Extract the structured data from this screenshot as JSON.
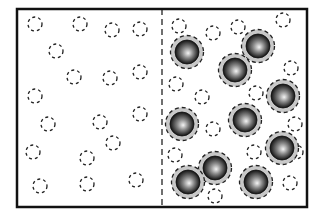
{
  "diagram": {
    "kind": "particle-membrane-diagram",
    "frame": {
      "x": 17,
      "y": 9,
      "width": 290,
      "height": 198,
      "stroke": "#111111"
    },
    "divider": {
      "x": 162,
      "style": "dashed",
      "stroke": "#111111"
    },
    "colors": {
      "small_dash": "#222222",
      "halo": "#c8c8c8",
      "halo_dash": "#222222",
      "sphere_dark": "#111111",
      "sphere_mid": "#666666",
      "sphere_light": "#f4f4f4"
    },
    "left_region": {
      "label": "small particles only",
      "small_particles": [
        [
          35,
          24
        ],
        [
          80,
          24
        ],
        [
          112,
          30
        ],
        [
          140,
          29
        ],
        [
          56,
          51
        ],
        [
          74,
          77
        ],
        [
          110,
          78
        ],
        [
          140,
          72
        ],
        [
          35,
          96
        ],
        [
          48,
          124
        ],
        [
          100,
          122
        ],
        [
          140,
          114
        ],
        [
          113,
          143
        ],
        [
          33,
          152
        ],
        [
          87,
          158
        ],
        [
          40,
          186
        ],
        [
          87,
          184
        ],
        [
          136,
          180
        ]
      ]
    },
    "right_region": {
      "label": "large spheres with halos and small particles",
      "small_particles": [
        [
          179,
          26
        ],
        [
          213,
          33
        ],
        [
          238,
          27
        ],
        [
          283,
          20
        ],
        [
          176,
          84
        ],
        [
          202,
          97
        ],
        [
          256,
          93
        ],
        [
          291,
          68
        ],
        [
          295,
          124
        ],
        [
          213,
          129
        ],
        [
          175,
          155
        ],
        [
          254,
          152
        ],
        [
          296,
          152
        ],
        [
          215,
          196
        ],
        [
          290,
          183
        ]
      ],
      "large_spheres": [
        [
          187,
          52
        ],
        [
          258,
          46
        ],
        [
          235,
          70
        ],
        [
          283,
          96
        ],
        [
          182,
          124
        ],
        [
          245,
          120
        ],
        [
          282,
          148
        ],
        [
          215,
          168
        ],
        [
          188,
          182
        ],
        [
          256,
          182
        ]
      ]
    }
  }
}
